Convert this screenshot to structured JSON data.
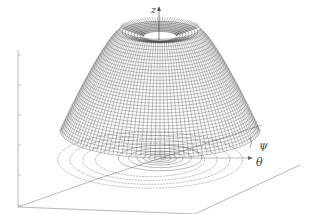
{
  "figure": {
    "type": "3d-surface-with-contour-projection",
    "axis_labels": {
      "z": "z",
      "psi": "ψ",
      "theta": "θ"
    },
    "colors": {
      "mesh": "#333333",
      "axis": "#888888",
      "contour": "#777777",
      "background": "#ffffff"
    }
  }
}
